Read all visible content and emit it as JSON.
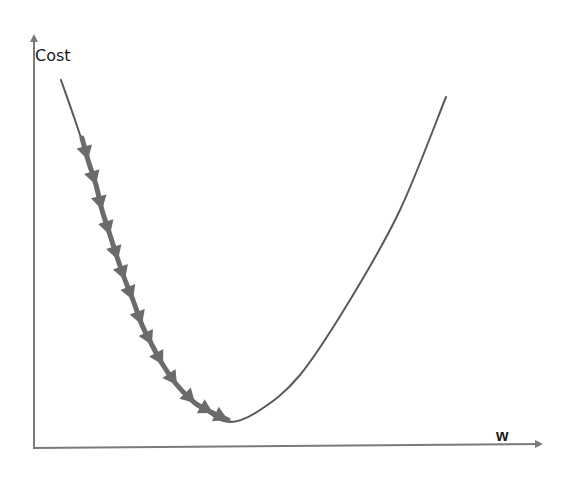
{
  "chart_data": {
    "type": "line",
    "title": "",
    "subtitle": "",
    "xlabel": "w",
    "ylabel": "Cost",
    "grid": false,
    "legend": null,
    "axis_ticks": "none",
    "curve": {
      "name": "cost-curve",
      "shape": "convex",
      "points_px": [
        [
          61,
          80
        ],
        [
          75,
          120
        ],
        [
          88,
          160
        ],
        [
          102,
          210
        ],
        [
          118,
          260
        ],
        [
          133,
          300
        ],
        [
          152,
          345
        ],
        [
          177,
          385
        ],
        [
          205,
          410
        ],
        [
          230,
          422
        ],
        [
          260,
          410
        ],
        [
          300,
          375
        ],
        [
          350,
          300
        ],
        [
          400,
          210
        ],
        [
          446,
          97
        ]
      ]
    },
    "minimum_px": [
      230,
      422
    ],
    "gradient_steps": {
      "count": 14,
      "direction": "downhill toward minimum",
      "arrowheads_px": [
        [
          88,
          160
        ],
        [
          96,
          185
        ],
        [
          102,
          210
        ],
        [
          110,
          235
        ],
        [
          118,
          260
        ],
        [
          125,
          280
        ],
        [
          133,
          300
        ],
        [
          142,
          325
        ],
        [
          152,
          345
        ],
        [
          163,
          365
        ],
        [
          177,
          385
        ],
        [
          195,
          403
        ],
        [
          213,
          413
        ],
        [
          228,
          420
        ]
      ]
    },
    "colors": {
      "curve": "#5a5a5a",
      "steps": "#6b6b6b",
      "axes": "#7a7a7a",
      "text": "#1a1a1a"
    }
  },
  "axes": {
    "y_label": "Cost",
    "x_label": "w"
  }
}
